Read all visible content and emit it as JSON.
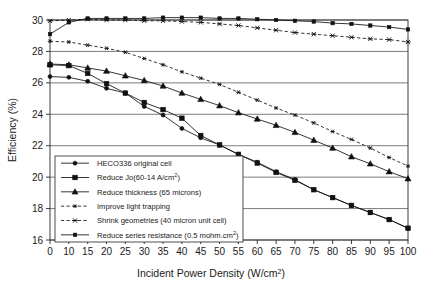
{
  "chart_data": {
    "type": "line",
    "title": "",
    "xlabel": "Incident Power Density (W/cm2)",
    "xlabel_base": "Incident Power Density (W/cm",
    "xlabel_sup": "2",
    "xlabel_tail": ")",
    "ylabel": "Efficiency (%)",
    "xlim": [
      0,
      100
    ],
    "ylim": [
      16,
      30
    ],
    "grid": true,
    "legend_position": "lower-left-inside",
    "xticks": [
      0,
      10,
      15,
      20,
      25,
      30,
      35,
      40,
      45,
      50,
      55,
      60,
      65,
      70,
      75,
      80,
      85,
      90,
      95,
      100
    ],
    "yticks": [
      16,
      18,
      20,
      22,
      24,
      26,
      28,
      30
    ],
    "series": [
      {
        "name": "HECO336 original cell",
        "marker": "circle",
        "line": "solid",
        "x": [
          0,
          10,
          15,
          20,
          25,
          30,
          35,
          40,
          45,
          50,
          55,
          60,
          65,
          70,
          75,
          80,
          85,
          90,
          95,
          100
        ],
        "values": [
          26.4,
          26.35,
          26.1,
          25.65,
          25.35,
          24.5,
          23.95,
          23.1,
          22.5,
          22.05,
          21.45,
          20.95,
          20.35,
          19.85,
          19.2,
          18.7,
          18.2,
          17.75,
          17.3,
          16.75
        ]
      },
      {
        "name": "Reduce Jo(60-14 A/cm2)",
        "name_base": "Reduce Jo(60-14 A/cm",
        "name_sup": "2",
        "name_tail": ")",
        "marker": "square",
        "line": "solid",
        "x": [
          0,
          10,
          15,
          20,
          25,
          30,
          35,
          40,
          45,
          50,
          55,
          60,
          65,
          70,
          75,
          80,
          85,
          90,
          95,
          100
        ],
        "values": [
          27.15,
          27.1,
          26.6,
          25.95,
          25.35,
          24.75,
          24.3,
          23.75,
          22.65,
          22.05,
          21.45,
          20.9,
          20.3,
          19.8,
          19.2,
          18.7,
          18.2,
          17.75,
          17.3,
          16.75
        ]
      },
      {
        "name": "Reduce thickness (65 microns)",
        "marker": "triangle",
        "line": "solid",
        "x": [
          0,
          10,
          15,
          20,
          25,
          30,
          35,
          40,
          45,
          50,
          55,
          60,
          65,
          70,
          75,
          80,
          85,
          90,
          95,
          100
        ],
        "values": [
          27.2,
          27.15,
          26.95,
          26.75,
          26.45,
          26.15,
          25.8,
          25.35,
          24.95,
          24.55,
          24.1,
          23.7,
          23.3,
          22.85,
          22.35,
          21.85,
          21.3,
          20.85,
          20.35,
          19.9
        ]
      },
      {
        "name": "Improve light trapping",
        "marker": "star6",
        "line": "dashed",
        "x": [
          0,
          10,
          15,
          20,
          25,
          30,
          35,
          40,
          45,
          50,
          55,
          60,
          65,
          70,
          75,
          80,
          85,
          90,
          95,
          100
        ],
        "values": [
          28.65,
          28.6,
          28.4,
          28.2,
          27.95,
          27.55,
          27.15,
          26.7,
          26.3,
          25.9,
          25.4,
          24.9,
          24.4,
          23.95,
          23.45,
          22.9,
          22.4,
          21.85,
          21.25,
          20.7
        ]
      },
      {
        "name": "Shrink geometries (40 micron unit cell)",
        "marker": "starx",
        "line": "dashed",
        "x": [
          0,
          10,
          15,
          20,
          25,
          30,
          35,
          40,
          45,
          50,
          55,
          60,
          65,
          70,
          75,
          80,
          85,
          90,
          95,
          100
        ],
        "values": [
          29.95,
          30.0,
          30.05,
          30.0,
          30.0,
          29.95,
          29.95,
          29.9,
          29.85,
          29.75,
          29.65,
          29.5,
          29.35,
          29.2,
          29.1,
          29.0,
          28.9,
          28.8,
          28.75,
          28.6
        ]
      },
      {
        "name": "Reduce series resistance (0.5 mohm.cm2)",
        "name_base": "Reduce series resistance (0.5 mohm.cm",
        "name_sup": "2",
        "name_tail": ")",
        "marker": "square-small",
        "line": "solid",
        "x": [
          0,
          10,
          15,
          20,
          25,
          30,
          35,
          40,
          45,
          50,
          55,
          60,
          65,
          70,
          75,
          80,
          85,
          90,
          95,
          100
        ],
        "values": [
          29.1,
          29.85,
          30.1,
          30.1,
          30.1,
          30.1,
          30.15,
          30.15,
          30.15,
          30.1,
          30.1,
          30.05,
          30.0,
          29.95,
          29.9,
          29.8,
          29.75,
          29.65,
          29.55,
          29.4
        ]
      }
    ]
  },
  "axes": {
    "y_label": "Efficiency (%)",
    "y_tick_labels": [
      "16",
      "18",
      "20",
      "22",
      "24",
      "26",
      "28",
      "30"
    ],
    "x_tick_labels": [
      "0",
      "10",
      "15",
      "20",
      "25",
      "30",
      "35",
      "40",
      "45",
      "50",
      "55",
      "60",
      "65",
      "70",
      "75",
      "80",
      "85",
      "90",
      "95",
      "100"
    ]
  },
  "legend": {
    "items": [
      {
        "label": "HECO336 original cell",
        "marker": "circle",
        "line": "solid"
      },
      {
        "label": "Reduce Jo(60-14 A/cm2)",
        "marker": "square",
        "line": "solid"
      },
      {
        "label": "Reduce thickness (65 microns)",
        "marker": "triangle",
        "line": "solid"
      },
      {
        "label": "Improve light trapping",
        "marker": "star6",
        "line": "dashed"
      },
      {
        "label": "Shrink geometries (40 micron unit cell)",
        "marker": "starx",
        "line": "dashed"
      },
      {
        "label": "Reduce series resistance (0.5 mohm.cm2)",
        "marker": "square-small",
        "line": "solid"
      }
    ]
  },
  "colors": {
    "line": "#111111",
    "grid": "#6e6e6e",
    "frame": "#3a3a3a",
    "background": "#ffffff",
    "text": "#1a1a1a"
  }
}
